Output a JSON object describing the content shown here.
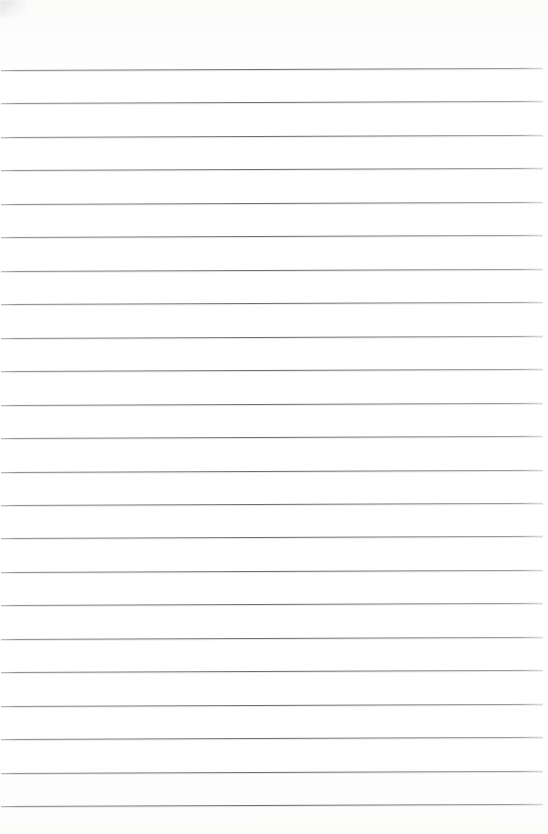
{
  "document": {
    "type": "scanned-lined-paper",
    "title": "Blank ruled notebook page",
    "page_text": "",
    "written_content": "",
    "is_blank": "true",
    "orientation": "portrait",
    "width_px": 548,
    "height_px": 834,
    "background_color": "#fdfdfc",
    "paper_color": "#ffffff"
  },
  "ruling": {
    "style": "wide-ruled horizontal lines",
    "line_color": "#6a6d71",
    "line_count": 23,
    "line_thickness_px": 1,
    "first_line_y": 70,
    "line_spacing_px": 33.45,
    "line_start_x": 1,
    "line_end_x": 543,
    "skew_degrees": -0.235,
    "margin_line": "none",
    "header_line": "none",
    "lines": [
      {
        "index": 1,
        "y": 70,
        "x1": 1,
        "x2": 543
      },
      {
        "index": 2,
        "y": 103,
        "x1": 1,
        "x2": 543
      },
      {
        "index": 3,
        "y": 137,
        "x1": 1,
        "x2": 543
      },
      {
        "index": 4,
        "y": 170,
        "x1": 1,
        "x2": 543
      },
      {
        "index": 5,
        "y": 204,
        "x1": 1,
        "x2": 543
      },
      {
        "index": 6,
        "y": 237,
        "x1": 1,
        "x2": 543
      },
      {
        "index": 7,
        "y": 271,
        "x1": 1,
        "x2": 543
      },
      {
        "index": 8,
        "y": 304,
        "x1": 1,
        "x2": 543
      },
      {
        "index": 9,
        "y": 338,
        "x1": 1,
        "x2": 543
      },
      {
        "index": 10,
        "y": 371,
        "x1": 1,
        "x2": 543
      },
      {
        "index": 11,
        "y": 405,
        "x1": 1,
        "x2": 543
      },
      {
        "index": 12,
        "y": 438,
        "x1": 1,
        "x2": 543
      },
      {
        "index": 13,
        "y": 472,
        "x1": 1,
        "x2": 543
      },
      {
        "index": 14,
        "y": 505,
        "x1": 1,
        "x2": 543
      },
      {
        "index": 15,
        "y": 538,
        "x1": 1,
        "x2": 543
      },
      {
        "index": 16,
        "y": 572,
        "x1": 1,
        "x2": 543
      },
      {
        "index": 17,
        "y": 605,
        "x1": 1,
        "x2": 543
      },
      {
        "index": 18,
        "y": 639,
        "x1": 1,
        "x2": 543
      },
      {
        "index": 19,
        "y": 672,
        "x1": 1,
        "x2": 543
      },
      {
        "index": 20,
        "y": 706,
        "x1": 1,
        "x2": 543
      },
      {
        "index": 21,
        "y": 739,
        "x1": 1,
        "x2": 543
      },
      {
        "index": 22,
        "y": 773,
        "x1": 1,
        "x2": 543
      },
      {
        "index": 23,
        "y": 806,
        "x1": 1,
        "x2": 543
      }
    ]
  },
  "artifacts": {
    "corner_smudge": {
      "name": "top-left-scan-smudge",
      "x": 0,
      "y": 0,
      "width": 26,
      "height": 17,
      "color": "#a8aaac"
    }
  },
  "margins": {
    "top_blank_px": 70,
    "bottom_blank_px": 28,
    "left_blank_px": 1,
    "right_blank_px": 5
  }
}
